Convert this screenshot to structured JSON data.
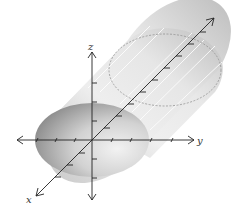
{
  "figure": {
    "axes": {
      "x": {
        "label": "x"
      },
      "y": {
        "label": "y"
      },
      "z": {
        "label": "z"
      }
    },
    "colors": {
      "axis": "#222222",
      "surface_light": "#f4f4f4",
      "surface_mid": "#d6d6d6",
      "surface_dark": "#9a9a9a",
      "hidden_edge": "#8a8a8a",
      "highlight": "#ffffff"
    }
  }
}
